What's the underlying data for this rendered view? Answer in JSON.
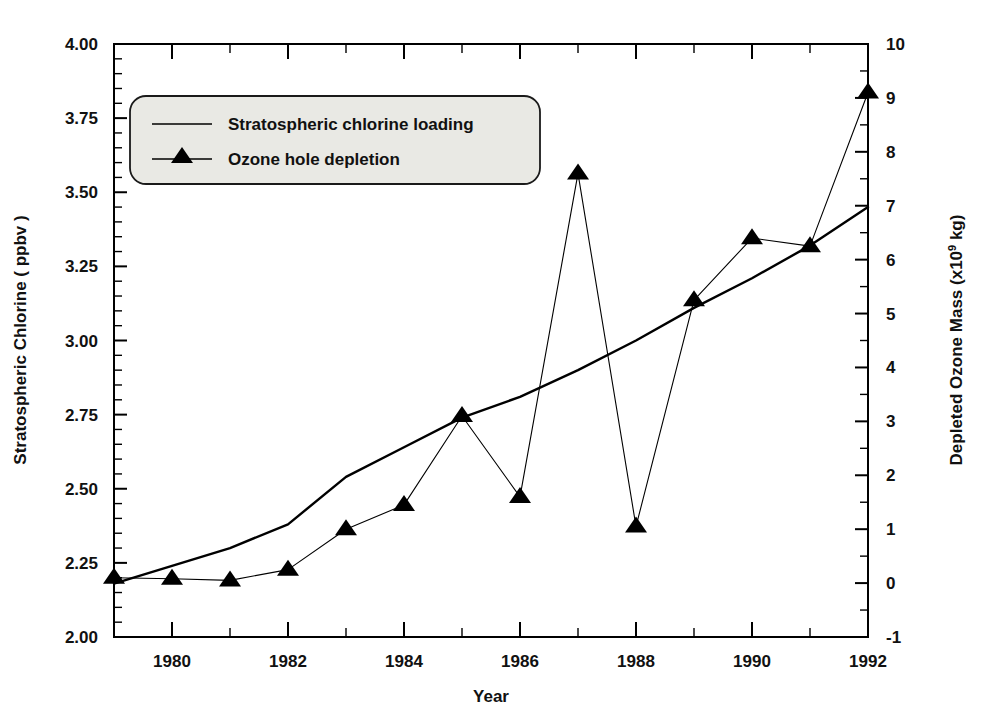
{
  "chart_data": {
    "type": "line",
    "title": "",
    "xlabel": "Year",
    "ylabel": "Stratospheric Chlorine ( ppbv )",
    "y2label_pre": "Depleted Ozone Mass (x10",
    "y2label_sup": "9",
    "y2label_post": " kg)",
    "xlim": [
      1979,
      1992
    ],
    "ylim": [
      2.0,
      4.0
    ],
    "y2lim": [
      -1,
      10
    ],
    "grid": false,
    "x": [
      1979,
      1980,
      1981,
      1982,
      1983,
      1984,
      1985,
      1986,
      1987,
      1988,
      1989,
      1990,
      1991,
      1992
    ],
    "xticks_major": [
      "1980",
      "1982",
      "1984",
      "1986",
      "1988",
      "1990",
      "1992"
    ],
    "xticks_major_values": [
      1980,
      1982,
      1984,
      1986,
      1988,
      1990,
      1992
    ],
    "xticks_minor_values": [
      1979,
      1981,
      1983,
      1985,
      1987,
      1989,
      1991
    ],
    "yticks": [
      "2.00",
      "2.25",
      "2.50",
      "2.75",
      "3.00",
      "3.25",
      "3.50",
      "3.75",
      "4.00"
    ],
    "yticks_values": [
      2.0,
      2.25,
      2.5,
      2.75,
      3.0,
      3.25,
      3.5,
      3.75,
      4.0
    ],
    "y2ticks": [
      "-1",
      "0",
      "1",
      "2",
      "3",
      "4",
      "5",
      "6",
      "7",
      "8",
      "9",
      "10"
    ],
    "y2ticks_values": [
      -1,
      0,
      1,
      2,
      3,
      4,
      5,
      6,
      7,
      8,
      9,
      10
    ],
    "series": [
      {
        "name": "Stratospheric chlorine loading",
        "axis": "left",
        "marker": "none",
        "linewidth": 2.4,
        "color": "#000000",
        "values": [
          2.18,
          2.24,
          2.3,
          2.38,
          2.54,
          2.64,
          2.74,
          2.81,
          2.9,
          3.0,
          3.11,
          3.21,
          3.32,
          3.45
        ]
      },
      {
        "name": "Ozone hole depletion",
        "axis": "right",
        "marker": "triangle",
        "linewidth": 1.1,
        "color": "#000000",
        "values": [
          0.1,
          0.08,
          0.05,
          0.25,
          1.0,
          1.45,
          3.1,
          1.6,
          7.6,
          1.05,
          5.25,
          6.4,
          6.25,
          9.1
        ]
      }
    ],
    "legend": {
      "position": "upper-left-inside",
      "entries": [
        {
          "label": "Stratospheric chlorine loading",
          "marker": "line"
        },
        {
          "label": "Ozone hole depletion",
          "marker": "triangle-line"
        }
      ]
    }
  },
  "colors": {
    "ink": "#000000",
    "background": "#ffffff",
    "legend_fill": "#e9e9e4",
    "legend_border": "#1a1a1a"
  }
}
